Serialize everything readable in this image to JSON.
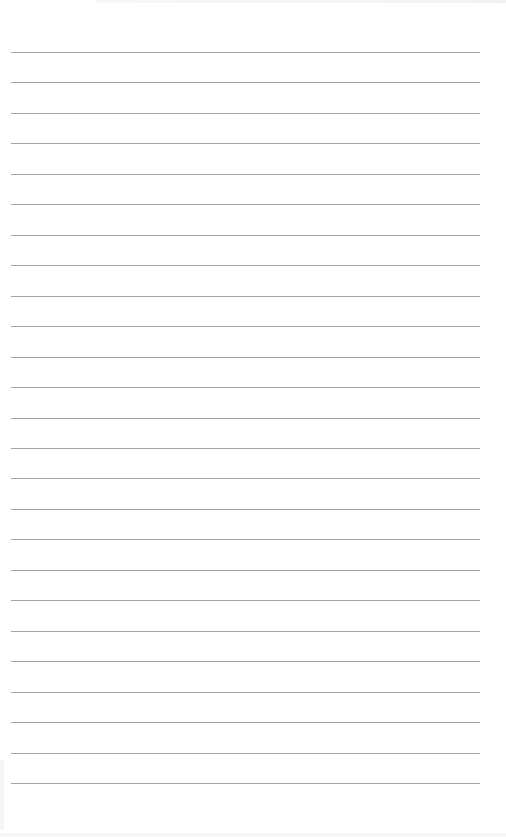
{
  "document": {
    "type": "lined-paper",
    "background_color": "#ffffff",
    "rule_color": "#a4a4a4",
    "rule_count": 25,
    "rule_left": 11,
    "rule_width": 469,
    "first_rule_y": 52,
    "rule_spacing": 30.46,
    "lines": [
      {
        "text": ""
      },
      {
        "text": ""
      },
      {
        "text": ""
      },
      {
        "text": ""
      },
      {
        "text": ""
      },
      {
        "text": ""
      },
      {
        "text": ""
      },
      {
        "text": ""
      },
      {
        "text": ""
      },
      {
        "text": ""
      },
      {
        "text": ""
      },
      {
        "text": ""
      },
      {
        "text": ""
      },
      {
        "text": ""
      },
      {
        "text": ""
      },
      {
        "text": ""
      },
      {
        "text": ""
      },
      {
        "text": ""
      },
      {
        "text": ""
      },
      {
        "text": ""
      },
      {
        "text": ""
      },
      {
        "text": ""
      },
      {
        "text": ""
      },
      {
        "text": ""
      },
      {
        "text": ""
      }
    ]
  }
}
